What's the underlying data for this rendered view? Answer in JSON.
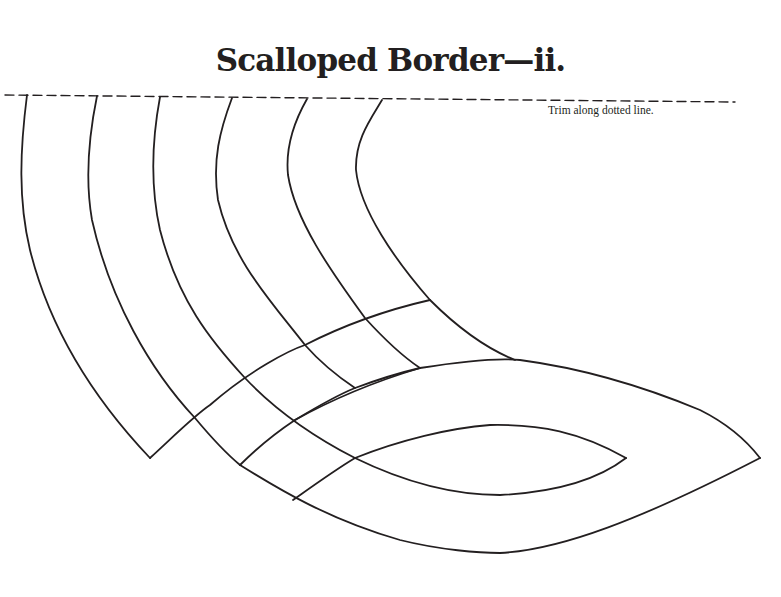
{
  "page": {
    "title": "Scalloped Border—ii.",
    "trim_note": "Trim along dotted line."
  },
  "pattern": {
    "stroke_color": "#231f20",
    "background": "#ffffff",
    "elements": [
      "dotted-trim-line",
      "scalloped-border-bands",
      "eye-shaped-loop"
    ]
  }
}
